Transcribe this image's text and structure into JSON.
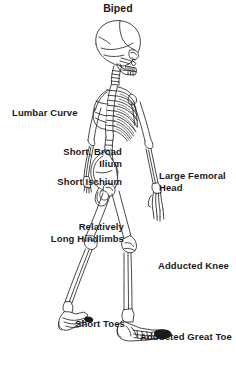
{
  "figure": {
    "title": "Biped",
    "background_color": "#ffffff",
    "ink_color": "#1a1a1a"
  },
  "labels": {
    "title": "Biped",
    "lumbar_curve": "Lumbar Curve",
    "short_broad_ilium": "Short, Broad\nIlium",
    "short_ischium": "Short Ischium",
    "relatively_long_hindlimbs": "Relatively\nLong Hindlimbs",
    "large_femoral_head": "Large Femoral\nHead",
    "adducted_knee": "Adducted Knee",
    "short_toes": "Short Toes",
    "adducted_great_toe": "Adducted Great Toe"
  }
}
